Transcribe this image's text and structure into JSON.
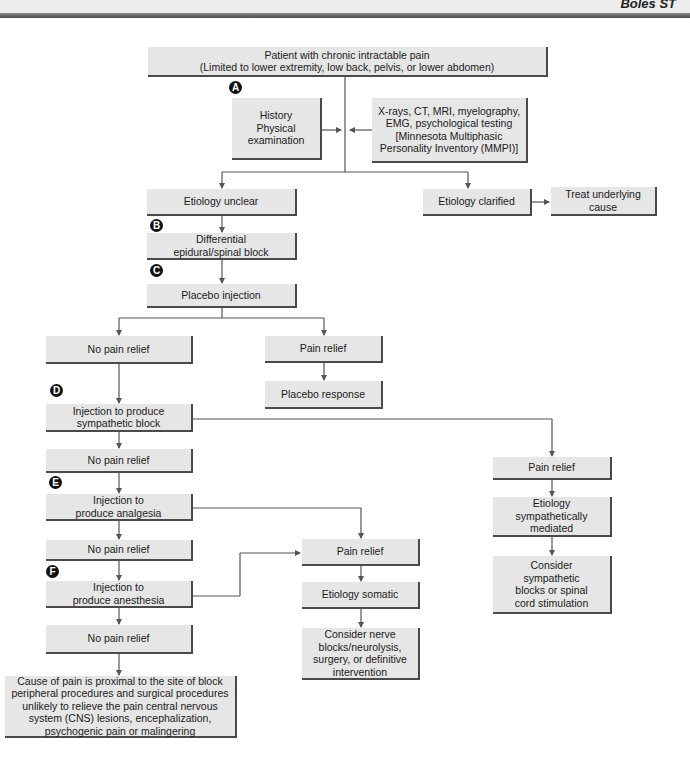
{
  "header": {
    "running_text": "Boles ST"
  },
  "flowchart": {
    "nodes": {
      "start": "Patient with chronic intractable pain\n(Limited to lower extremity, low back, pelvis, or lower abdomen)",
      "history": "History\nPhysical\nexamination",
      "tests": "X-rays, CT, MRI, myelography,\nEMG, psychological testing\n[Minnesota Multiphasic\nPersonality Inventory (MMPI)]",
      "etiology_unclear": "Etiology unclear",
      "etiology_clarified": "Etiology clarified",
      "treat_underlying": "Treat underlying\ncause",
      "differential_block": "Differential\nepidural/spinal block",
      "placebo_injection": "Placebo injection",
      "no_relief_1": "No pain relief",
      "placebo_pain_relief": "Pain relief",
      "placebo_response": "Placebo response",
      "sympathetic_injection": "Injection to produce\nsympathetic block",
      "no_relief_2": "No pain relief",
      "sympathetic_pain_relief": "Pain relief",
      "etiology_sympathetic": "Etiology\nsympathetically\nmediated",
      "consider_sympathetic": "Consider\nsympathetic\nblocks or spinal\ncord stimulation",
      "analgesia_injection": "Injection to\nproduce analgesia",
      "no_relief_3": "No pain relief",
      "somatic_pain_relief": "Pain relief",
      "anesthesia_injection": "Injection to\nproduce anesthesia",
      "etiology_somatic": "Etiology somatic",
      "no_relief_4": "No pain relief",
      "consider_nerve": "Consider nerve\nblocks/neurolysis,\nsurgery, or definitive\nintervention",
      "central_cause": "Cause of pain is proximal to the site of block\nperipheral procedures and surgical procedures\nunlikely to relieve the pain central nervous\nsystem (CNS) lesions, encephalization,\npsychogenic pain or malingering"
    },
    "badges": {
      "a": "A",
      "b": "B",
      "c": "C",
      "d": "D",
      "e": "E",
      "f": "F"
    },
    "colors": {
      "box_fill": "#e6e6e6",
      "box_shadow": "#4a4a4a",
      "line": "#555555",
      "badge": "#111111"
    }
  }
}
